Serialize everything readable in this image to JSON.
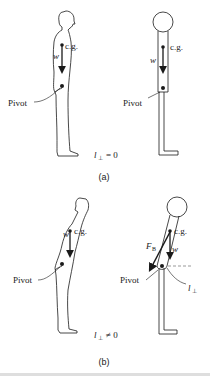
{
  "figure": {
    "panel_a": {
      "label": "(a)",
      "equation_lhs": "l",
      "equation_sub": "⊥",
      "equation_rhs": "= 0",
      "person": {
        "cg_label": "c.g.",
        "weight_label": "w",
        "pivot_label": "Pivot"
      },
      "model": {
        "cg_label": "c.g.",
        "weight_label": "w",
        "pivot_label": "Pivot"
      }
    },
    "panel_b": {
      "label": "(b)",
      "equation_lhs": "l",
      "equation_sub": "⊥",
      "equation_rhs": "≠ 0",
      "person": {
        "cg_label": "c.g.",
        "weight_label": "w",
        "pivot_label": "Pivot"
      },
      "model": {
        "cg_label": "c.g.",
        "weight_label": "w",
        "pivot_label": "Pivot",
        "force_label": "F",
        "force_sub": "B",
        "lever_label": "l",
        "lever_sub": "⊥"
      }
    }
  },
  "colors": {
    "ink": "#1a1a1a",
    "background": "#ffffff",
    "dashed": "#555555"
  }
}
